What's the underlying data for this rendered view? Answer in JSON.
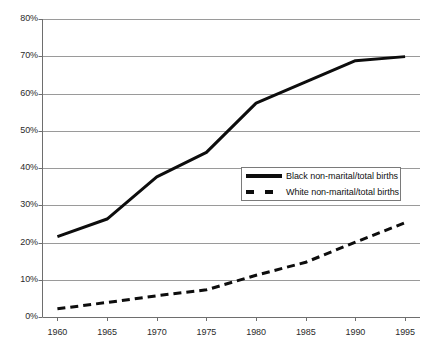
{
  "chart_data": {
    "type": "line",
    "title": "",
    "subtitle": "",
    "xlabel": "",
    "ylabel": "",
    "xlim": [
      1958.5,
      1996.5
    ],
    "ylim": [
      0,
      80
    ],
    "grid": true,
    "grid_axis": "y",
    "legend_position": "center-right",
    "x": [
      1960,
      1965,
      1970,
      1975,
      1980,
      1985,
      1990,
      1995
    ],
    "categories": [
      "1960",
      "1965",
      "1970",
      "1975",
      "1980",
      "1985",
      "1990",
      "1995"
    ],
    "xticks": [
      "1960",
      "1965",
      "1970",
      "1975",
      "1980",
      "1985",
      "1990",
      "1995"
    ],
    "yticks": [
      "0%",
      "10%",
      "20%",
      "30%",
      "40%",
      "50%",
      "60%",
      "70%",
      "80%"
    ],
    "ytick_values": [
      0,
      10,
      20,
      30,
      40,
      50,
      60,
      70,
      80
    ],
    "series": [
      {
        "name": "Black non-marital/total births",
        "style": "solid",
        "color": "#0d0d0d",
        "width": 3,
        "values": [
          21.6,
          26.3,
          37.6,
          44.2,
          57.4,
          63.1,
          68.8,
          69.9
        ]
      },
      {
        "name": "White non-marital/total births",
        "style": "dashed",
        "color": "#0d0d0d",
        "width": 3,
        "values": [
          2.2,
          3.9,
          5.7,
          7.3,
          11.2,
          14.7,
          20.1,
          25.3
        ]
      }
    ]
  },
  "legend": {
    "items": [
      {
        "label": "Black non-marital/total births",
        "style": "solid"
      },
      {
        "label": "White non-marital/total births",
        "style": "dashed"
      }
    ]
  },
  "axes": {
    "y": {
      "ticks": [
        {
          "label": "80%",
          "value": 80
        },
        {
          "label": "70%",
          "value": 70
        },
        {
          "label": "60%",
          "value": 60
        },
        {
          "label": "50%",
          "value": 50
        },
        {
          "label": "40%",
          "value": 40
        },
        {
          "label": "30%",
          "value": 30
        },
        {
          "label": "20%",
          "value": 20
        },
        {
          "label": "10%",
          "value": 10
        },
        {
          "label": "0%",
          "value": 0
        }
      ]
    },
    "x": {
      "ticks": [
        {
          "label": "1960",
          "value": 1960
        },
        {
          "label": "1965",
          "value": 1965
        },
        {
          "label": "1970",
          "value": 1970
        },
        {
          "label": "1975",
          "value": 1975
        },
        {
          "label": "1980",
          "value": 1980
        },
        {
          "label": "1985",
          "value": 1985
        },
        {
          "label": "1990",
          "value": 1990
        },
        {
          "label": "1995",
          "value": 1995
        }
      ]
    }
  },
  "colors": {
    "line": "#0d0d0d",
    "grid": "#9a9a9a",
    "axis": "#6e6e6e",
    "text": "#2b2b2b",
    "background": "#ffffff"
  }
}
